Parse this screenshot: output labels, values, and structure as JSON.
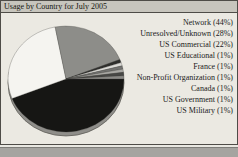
{
  "window": {
    "title": "Usage by Country for July 2005"
  },
  "chart_data": {
    "type": "pie",
    "title": "Usage by Country for July 2005",
    "style": "3d",
    "start_angle_deg": 0,
    "direction": "clockwise",
    "unit": "%",
    "labels": [
      "Network",
      "Unresolved/Unknown",
      "US Commercial",
      "US Educational",
      "France",
      "Non-Profit Organization",
      "Canada",
      "US Government",
      "US Military"
    ],
    "values": [
      44,
      28,
      22,
      1,
      1,
      1,
      1,
      1,
      1
    ],
    "colors": [
      "#161614",
      "#f5f4f0",
      "#8d8d89",
      "#2e2e2c",
      "#dcdbd7",
      "#727270",
      "#a9a8a4",
      "#474745",
      "#8a8986"
    ],
    "legend_labels": [
      "Network (44%)",
      "Unresolved/Unknown (28%)",
      "US Commercial (22%)",
      "US Educational (1%)",
      "France (1%)",
      "Non-Profit Organization (1%)",
      "Canada (1%)",
      "US Government (1%)",
      "US Military (1%)"
    ],
    "legend_position": "right"
  },
  "colors": {
    "panel_border": "#4e4c47",
    "titlebar_bg": "#c7c5bd",
    "chart_bg": "#ebe9e2",
    "page_bg": "#e9e8e2",
    "bottom_strip_bg": "#a5a4a0",
    "bottom_strip_border": "#7e7d79",
    "legend_text": "#1a1a1a",
    "pie_depth": "#8f8e8a",
    "pie_outline": "#55534e"
  }
}
